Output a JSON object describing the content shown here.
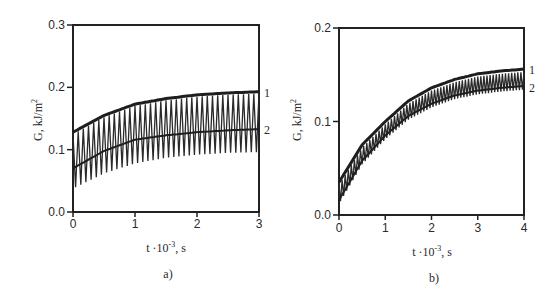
{
  "chart_data": [
    {
      "panel": "a)",
      "type": "line",
      "xlabel": "t · 10^-3, s",
      "ylabel": "G, kJ/m²",
      "xlim": [
        0,
        3
      ],
      "ylim": [
        0,
        0.3
      ],
      "xticks": [
        "0",
        "1",
        "2",
        "3"
      ],
      "yticks": [
        "0.0",
        "0.1",
        "0.2",
        "0.3"
      ],
      "grid": false,
      "series": [
        {
          "name": "1",
          "x": [
            0,
            0.5,
            1,
            1.5,
            2,
            2.5,
            3
          ],
          "values": [
            0.128,
            0.155,
            0.173,
            0.182,
            0.188,
            0.191,
            0.193
          ]
        },
        {
          "name": "2",
          "x": [
            0,
            0.5,
            1,
            1.5,
            2,
            2.5,
            3
          ],
          "values": [
            0.07,
            0.098,
            0.116,
            0.123,
            0.128,
            0.131,
            0.133
          ]
        },
        {
          "name": "oscillation envelope (lower)",
          "x": [
            0,
            0.5,
            1,
            1.5,
            2,
            2.5,
            3
          ],
          "values": [
            0.038,
            0.062,
            0.078,
            0.087,
            0.092,
            0.095,
            0.096
          ]
        }
      ],
      "annotations": [
        "1",
        "2"
      ]
    },
    {
      "panel": "b)",
      "type": "line",
      "xlabel": "t · 10^-3, s",
      "ylabel": "G, kJ/m²",
      "xlim": [
        0,
        4
      ],
      "ylim": [
        0,
        0.2
      ],
      "xticks": [
        "0",
        "1",
        "2",
        "3",
        "4"
      ],
      "yticks": [
        "0.0",
        "0.1",
        "0.2"
      ],
      "grid": false,
      "series": [
        {
          "name": "1",
          "x": [
            0,
            0.5,
            1,
            1.5,
            2,
            2.5,
            3,
            3.5,
            4
          ],
          "values": [
            0.035,
            0.075,
            0.1,
            0.122,
            0.136,
            0.145,
            0.151,
            0.154,
            0.156
          ]
        },
        {
          "name": "2",
          "x": [
            0,
            0.5,
            1,
            1.5,
            2,
            2.5,
            3,
            3.5,
            4
          ],
          "values": [
            0.016,
            0.058,
            0.085,
            0.106,
            0.119,
            0.128,
            0.133,
            0.136,
            0.138
          ]
        }
      ],
      "annotations": [
        "1",
        "2"
      ]
    }
  ],
  "panels": {
    "a": {
      "label": "a)",
      "ylabel": "G, kJ/m",
      "ylabel_sup": "2",
      "xlabel_pre": "t ·10",
      "xlabel_sup": "-3",
      "xlabel_post": ", s",
      "yticks": [
        "0.0",
        "0.1",
        "0.2",
        "0.3"
      ],
      "xticks": [
        "0",
        "1",
        "2",
        "3"
      ],
      "curve1": "1",
      "curve2": "2"
    },
    "b": {
      "label": "b)",
      "ylabel": "G, kJ/m",
      "ylabel_sup": "2",
      "xlabel_pre": "t ·10",
      "xlabel_sup": "-3",
      "xlabel_post": ", s",
      "yticks": [
        "0.0",
        "0.1",
        "0.2"
      ],
      "xticks": [
        "0",
        "1",
        "2",
        "3",
        "4"
      ],
      "curve1": "1",
      "curve2": "2"
    }
  }
}
